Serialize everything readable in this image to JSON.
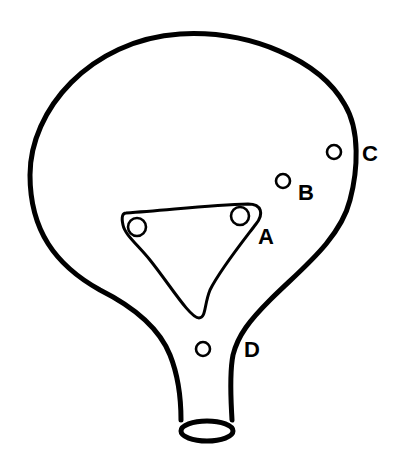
{
  "diagram": {
    "colors": {
      "stroke": "#000000",
      "background": "#ffffff"
    },
    "labels": {
      "a": "A",
      "b": "B",
      "c": "C",
      "d": "D"
    }
  }
}
